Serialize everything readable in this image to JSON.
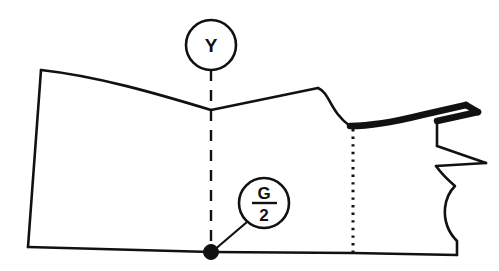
{
  "diagram": {
    "type": "technical-line-drawing",
    "background_color": "#ffffff",
    "line_color": "#111111",
    "callouts": [
      {
        "id": "y-callout",
        "label": "Y",
        "shape": "circle",
        "center": {
          "x": 211,
          "y": 45
        },
        "radius": 25,
        "leader_to": {
          "x": 211,
          "y": 110
        }
      },
      {
        "id": "g-over-2-callout",
        "label": "G/2",
        "numerator": "G",
        "denominator": "2",
        "shape": "circle",
        "center": {
          "x": 264,
          "y": 203
        },
        "radius": 25,
        "leader_to": {
          "x": 211,
          "y": 252
        }
      }
    ],
    "markers": [
      {
        "id": "origin-point",
        "shape": "filled-dot",
        "center": {
          "x": 211,
          "y": 252
        },
        "radius": 7
      }
    ],
    "construction_lines": [
      {
        "id": "center-front-dashed",
        "style": "dashed",
        "from": {
          "x": 211,
          "y": 70
        },
        "to": {
          "x": 211,
          "y": 252
        }
      },
      {
        "id": "armhole-dotted-guide",
        "style": "dotted",
        "from": {
          "x": 353,
          "y": 128
        },
        "to": {
          "x": 353,
          "y": 253
        }
      }
    ],
    "emphasized_edge": {
      "id": "neckline-bold-edge",
      "style": "thick",
      "description": "bold shoulder / neckline seam segment on the upper right"
    }
  },
  "geometry": {
    "outline_main": "M 41 70 C 100 77, 160 94, 211 110 L 318 88 C 331 92, 333 110, 353 127 L 353 253 L 457 255 L 457 241 C 450 232, 446 220, 447 207 C 448 198, 452 190, 456 185 C 449 179, 443 172, 439 165 L 489 163 L 437 145 L 437 122 L 484 113 L 470 106 L 424 116 C 400 122, 375 126, 353 127 M 41 70 L 28 247 L 211 252 L 353 253",
    "outline_bold": "M 353 127 C 375 126, 400 121, 424 115 L 470 106 L 484 113 L 437 122",
    "bottom_edge": "M 28 247 L 457 255"
  }
}
